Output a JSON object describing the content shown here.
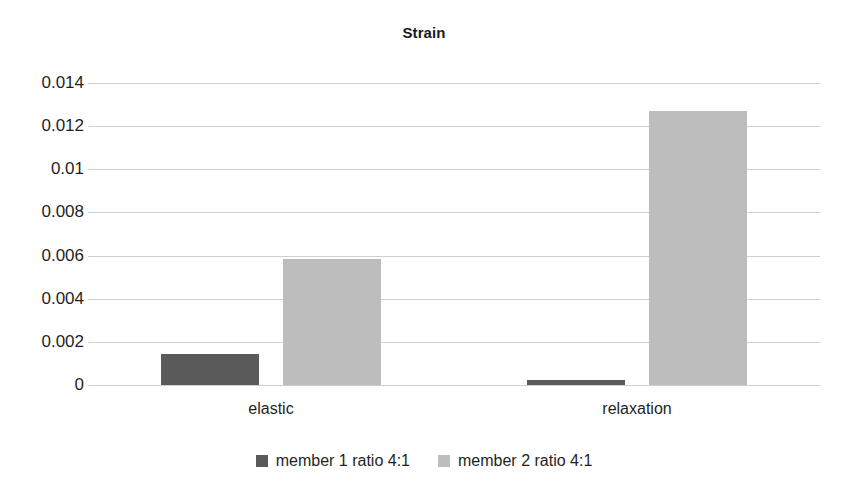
{
  "chart_data": {
    "type": "bar",
    "title": "Strain",
    "xlabel": "",
    "ylabel": "",
    "categories": [
      "elastic",
      "relaxation"
    ],
    "series": [
      {
        "name": "member 1 ratio 4:1",
        "color": "#5a5a5a",
        "values": [
          0.00144,
          0.00023
        ]
      },
      {
        "name": "member 2 ratio 4:1",
        "color": "#bdbdbd",
        "values": [
          0.00584,
          0.0127
        ]
      }
    ],
    "ylim": [
      0,
      0.014
    ],
    "yticks": [
      0,
      0.002,
      0.004,
      0.006,
      0.008,
      0.01,
      0.012,
      0.014
    ],
    "ytick_labels": [
      "0",
      "0.002",
      "0.004",
      "0.006",
      "0.008",
      "0.01",
      "0.012",
      "0.014"
    ],
    "grid": true,
    "grid_color": "#d0d0d0",
    "legend_position": "bottom",
    "background": "#ffffff"
  }
}
